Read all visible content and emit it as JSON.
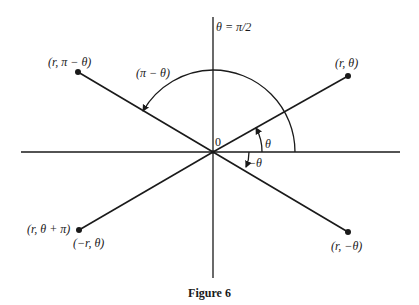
{
  "figure": {
    "caption": "Figure 6",
    "origin_label": "0",
    "axis_label": "θ = π/2",
    "points": {
      "r_theta": "(r, θ)",
      "r_pi_minus_theta": "(r, π − θ)",
      "r_theta_plus_pi": "(r, θ + π)",
      "neg_r_theta": "(−r, θ)",
      "r_neg_theta": "(r, −θ)"
    },
    "angles": {
      "theta": "θ",
      "neg_theta": "−θ",
      "pi_minus_theta": "(π − θ)"
    },
    "colors": {
      "ink": "#1a1a1a",
      "background": "#ffffff"
    }
  }
}
